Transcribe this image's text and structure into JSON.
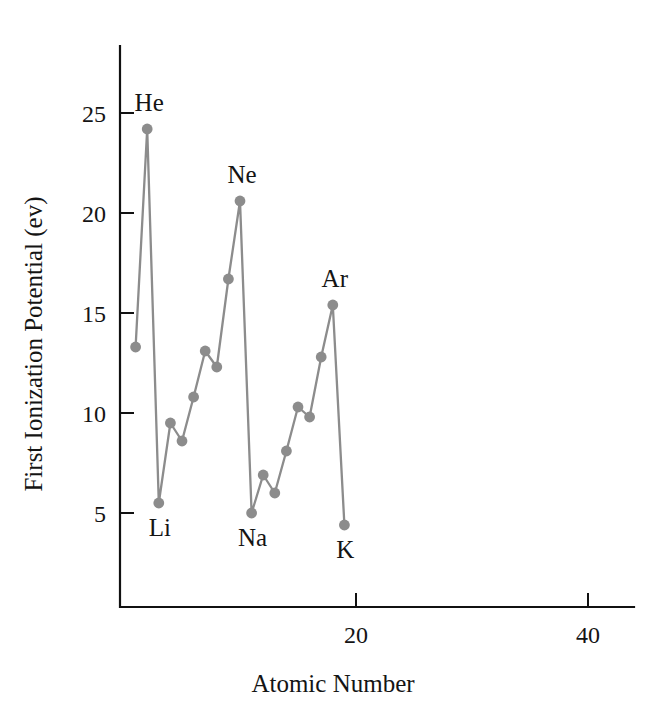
{
  "chart_data": {
    "type": "line",
    "title": "",
    "xlabel": "Atomic Number",
    "ylabel": "First Ionization Potential (ev)",
    "xlim": [
      0,
      44
    ],
    "ylim": [
      2.6,
      27.6
    ],
    "grid": false,
    "legend": "none",
    "xticks": [
      20,
      40
    ],
    "xtick_labels": [
      "20",
      "40"
    ],
    "yticks": [
      5,
      10,
      15,
      20,
      25
    ],
    "ytick_labels": [
      "5",
      "10",
      "15",
      "20",
      "25"
    ],
    "series": [
      {
        "name": "First ionization potential",
        "color": "#8c8c8c",
        "marker": "circle",
        "x": [
          1,
          2,
          3,
          4,
          5,
          6,
          7,
          8,
          9,
          10,
          11,
          12,
          13,
          14,
          15,
          16,
          17,
          18,
          19
        ],
        "y": [
          13.3,
          24.2,
          5.5,
          9.5,
          8.6,
          10.8,
          13.1,
          12.3,
          16.7,
          20.6,
          5.0,
          6.9,
          6.0,
          8.1,
          10.3,
          9.8,
          12.8,
          15.4,
          4.4
        ]
      }
    ],
    "annotations": [
      {
        "text": "He",
        "x": 2,
        "y": 24.2,
        "position": "above"
      },
      {
        "text": "Ne",
        "x": 10,
        "y": 20.6,
        "position": "above"
      },
      {
        "text": "Ar",
        "x": 18,
        "y": 15.4,
        "position": "above"
      },
      {
        "text": "Li",
        "x": 3,
        "y": 5.5,
        "position": "below"
      },
      {
        "text": "Na",
        "x": 11,
        "y": 5.0,
        "position": "below"
      },
      {
        "text": "K",
        "x": 19,
        "y": 4.4,
        "position": "below"
      }
    ]
  },
  "colors": {
    "series": "#8c8c8c",
    "axis": "#111111",
    "text": "#141414",
    "background": "#ffffff"
  }
}
